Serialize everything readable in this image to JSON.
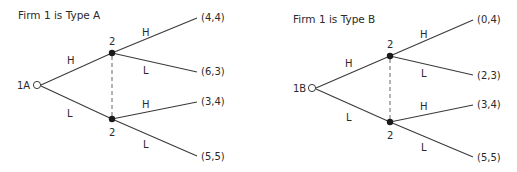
{
  "diagram": {
    "type": "game-tree",
    "trees": [
      {
        "title": "Firm 1 is Type A",
        "root_label": "1A",
        "info_set_player": "2",
        "first_moves": [
          "H",
          "L"
        ],
        "second_moves": [
          "H",
          "L"
        ],
        "payoffs": {
          "HH": "(4,4)",
          "HL": "(6,3)",
          "LH": "(3,4)",
          "LL": "(5,5)"
        }
      },
      {
        "title": "Firm 1 is Type B",
        "root_label": "1B",
        "info_set_player": "2",
        "first_moves": [
          "H",
          "L"
        ],
        "second_moves": [
          "H",
          "L"
        ],
        "payoffs": {
          "HH": "(0,4)",
          "HL": "(2,3)",
          "LH": "(3,4)",
          "LL": "(5,5)"
        }
      }
    ]
  }
}
